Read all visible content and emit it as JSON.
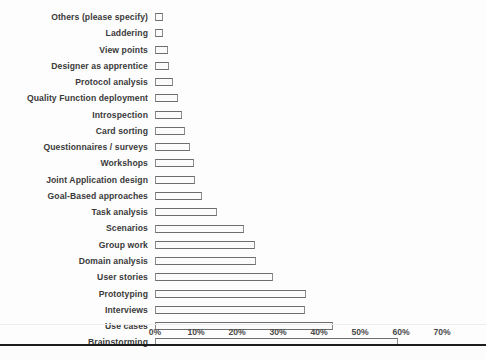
{
  "chart_data": {
    "type": "bar",
    "orientation": "horizontal",
    "title": "",
    "xlabel": "",
    "ylabel": "",
    "xlim": [
      0,
      70
    ],
    "xunit": "%",
    "grid": false,
    "legend": null,
    "xticks": [
      "0%",
      "10%",
      "20%",
      "30%",
      "40%",
      "50%",
      "60%",
      "70%"
    ],
    "xtick_values": [
      0,
      10,
      20,
      30,
      40,
      50,
      60,
      70
    ],
    "categories": [
      "Others (please specify)",
      "Laddering",
      "View points",
      "Designer as  apprentice",
      "Protocol analysis",
      "Quality Function deployment",
      "Introspection",
      "Card sorting",
      "Questionnaires / surveys",
      "Workshops",
      "Joint Application design",
      "Goal-Based  approaches",
      "Task analysis",
      "Scenarios",
      "Group work",
      "Domain analysis",
      "User stories",
      "Prototyping",
      "Interviews",
      "Use cases",
      "Brainstorming"
    ],
    "values": [
      2.0,
      2.0,
      3.2,
      3.4,
      4.4,
      5.6,
      6.6,
      7.4,
      8.6,
      9.4,
      9.8,
      11.4,
      15.0,
      21.8,
      24.4,
      24.6,
      28.8,
      36.8,
      36.6,
      43.4,
      59.3
    ]
  },
  "style": {
    "bar_border_color": "#6d6d6d",
    "bar_fill_color": "#fbfbfb",
    "label_color": "#3a3a3a",
    "axis_rule_color": "#1d1d1d",
    "background": "#fdfdfd"
  }
}
